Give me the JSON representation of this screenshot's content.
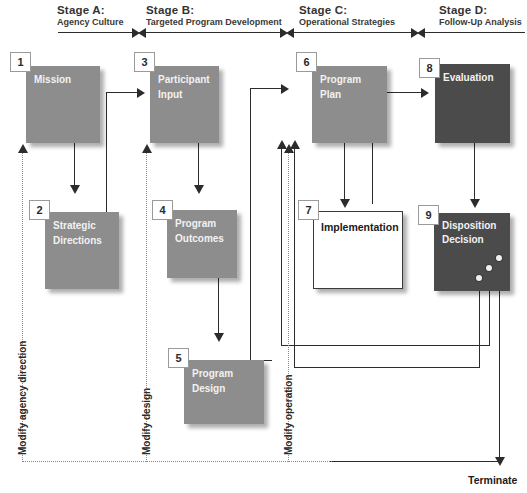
{
  "diagram": {
    "colors": {
      "box_light": "#8d8d8d",
      "box_dark": "#4b4b4b",
      "box_white": "#ffffff",
      "line": "#2c2c2c",
      "dotted_line": "#8a8a8a",
      "tag_border": "#9a9a9a"
    },
    "stages": [
      {
        "id": "A",
        "title": "Stage A:",
        "subtitle": "Agency Culture"
      },
      {
        "id": "B",
        "title": "Stage B:",
        "subtitle": "Targeted Program Development"
      },
      {
        "id": "C",
        "title": "Stage C:",
        "subtitle": "Operational Strategies"
      },
      {
        "id": "D",
        "title": "Stage D:",
        "subtitle": "Follow-Up Analysis"
      }
    ],
    "boxes": [
      {
        "number": "1",
        "label": "Mission",
        "style": "light"
      },
      {
        "number": "2",
        "label": "Strategic\nDirections",
        "style": "light"
      },
      {
        "number": "3",
        "label": "Participant\nInput",
        "style": "light"
      },
      {
        "number": "4",
        "label": "Program\nOutcomes",
        "style": "light"
      },
      {
        "number": "5",
        "label": "Program Design",
        "style": "light"
      },
      {
        "number": "6",
        "label": "Program Plan",
        "style": "light"
      },
      {
        "number": "7",
        "label": "Implementation",
        "style": "white"
      },
      {
        "number": "8",
        "label": "Evaluation",
        "style": "dark"
      },
      {
        "number": "9",
        "label": "Disposition\nDecision",
        "style": "dark"
      }
    ],
    "feedback_labels": [
      {
        "key": "agency",
        "text": "Modify agency direction"
      },
      {
        "key": "design",
        "text": "Modify design"
      },
      {
        "key": "operation",
        "text": "Modify operation"
      }
    ],
    "terminal_label": "Terminate"
  }
}
